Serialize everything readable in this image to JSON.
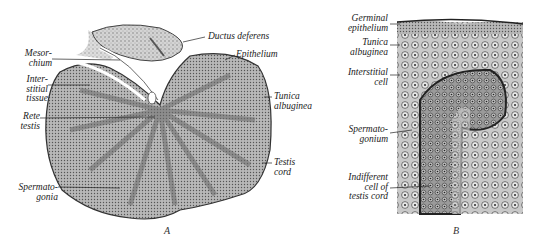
{
  "figure": {
    "panel_a": {
      "caption": "A",
      "labels": [
        {
          "id": "ductus-deferens",
          "text": "Ductus deferens"
        },
        {
          "id": "epithelium",
          "text": "Epithelium"
        },
        {
          "id": "mesorchium",
          "text": "Mesor-\nchium"
        },
        {
          "id": "interstitial-tissue",
          "text": "Inter-\nstitial\ntissue"
        },
        {
          "id": "rete-testis",
          "text": "Rete\ntestis"
        },
        {
          "id": "tunica-albuginea",
          "text": "Tunica\nalbuginea"
        },
        {
          "id": "testis-cord",
          "text": "Testis\ncord"
        },
        {
          "id": "spermatogonia",
          "text": "Spermato-\ngonia"
        }
      ]
    },
    "panel_b": {
      "caption": "B",
      "labels": [
        {
          "id": "germinal-epithelium",
          "text": "Germinal\nepithelium"
        },
        {
          "id": "tunica-albuginea-b",
          "text": "Tunica\nalbuginea"
        },
        {
          "id": "interstitial-cell",
          "text": "Interstitial\ncell"
        },
        {
          "id": "spermatogonium",
          "text": "Spermato-\ngonium"
        },
        {
          "id": "indifferent-cell",
          "text": "Indifferent\ncell of\ntestis cord"
        }
      ]
    }
  }
}
